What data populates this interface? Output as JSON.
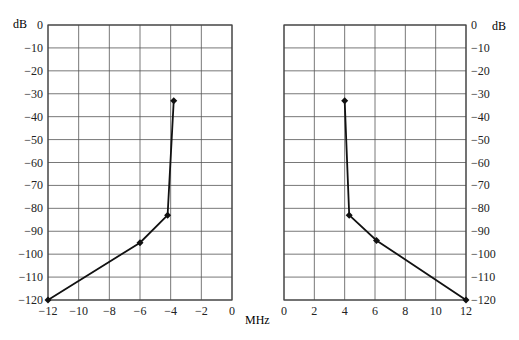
{
  "chart_data": [
    {
      "type": "line",
      "title": "",
      "xlabel": "MHz",
      "ylabel": "dB",
      "xlim": [
        -12,
        0
      ],
      "ylim": [
        -120,
        0
      ],
      "x_ticks": [
        -12,
        -10,
        -8,
        -6,
        -4,
        -2,
        0
      ],
      "y_ticks": [
        0,
        -10,
        -20,
        -30,
        -40,
        -50,
        -60,
        -70,
        -80,
        -90,
        -100,
        -110,
        -120
      ],
      "grid": true,
      "y_axis_side": "left",
      "series": [
        {
          "name": "lower sideband mask",
          "x": [
            -12,
            -6,
            -4.2,
            -3.8
          ],
          "y": [
            -120,
            -95,
            -83,
            -33
          ]
        }
      ]
    },
    {
      "type": "line",
      "title": "",
      "xlabel": "MHz",
      "ylabel": "dB",
      "xlim": [
        0,
        12
      ],
      "ylim": [
        -120,
        0
      ],
      "x_ticks": [
        0,
        2,
        4,
        6,
        8,
        10,
        12
      ],
      "y_ticks": [
        0,
        -10,
        -20,
        -30,
        -40,
        -50,
        -60,
        -70,
        -80,
        -90,
        -100,
        -110,
        -120
      ],
      "grid": true,
      "y_axis_side": "right",
      "series": [
        {
          "name": "upper sideband mask",
          "x": [
            4.0,
            4.3,
            6.1,
            12
          ],
          "y": [
            -33,
            -83,
            -94,
            -120
          ]
        }
      ]
    }
  ],
  "labels": {
    "y_unit_left": "dB",
    "y_unit_right": "dB",
    "x_unit": "MHz"
  },
  "style": {
    "line_color": "#111111",
    "grid_color": "#555555",
    "frame_color": "#444444"
  }
}
